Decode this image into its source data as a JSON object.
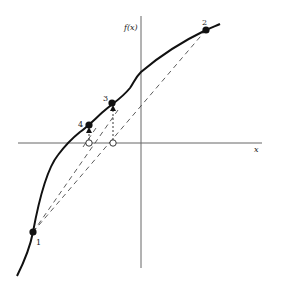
{
  "diagram": {
    "type": "secant-method-illustration",
    "axes": {
      "y_label": "f(x)",
      "x_label": "x"
    },
    "points": [
      {
        "id": "1",
        "label": "1"
      },
      {
        "id": "2",
        "label": "2"
      },
      {
        "id": "3",
        "label": "3"
      },
      {
        "id": "4",
        "label": "4"
      }
    ],
    "colors": {
      "curve": "#111111",
      "axes": "#555555",
      "dashed": "#333333"
    }
  }
}
